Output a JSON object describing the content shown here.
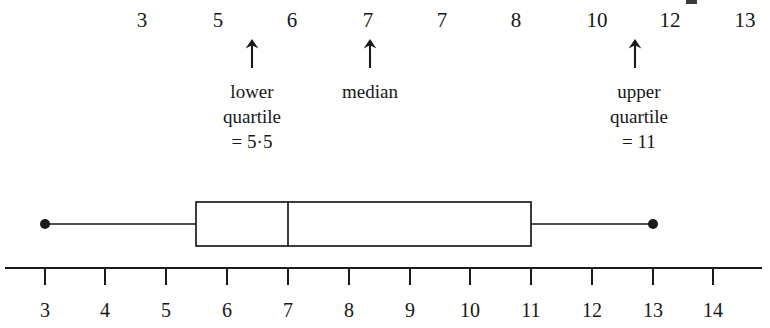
{
  "figure": {
    "type": "box-plot"
  },
  "data_list": {
    "label": "ordered data values",
    "values": [
      "3",
      "5",
      "6",
      "7",
      "7",
      "8",
      "10",
      "12",
      "13"
    ],
    "x_positions": [
      142,
      218,
      292,
      368,
      442,
      516,
      597,
      670,
      745
    ]
  },
  "annotations": [
    {
      "name": "lower-quartile",
      "arrow_x": 252,
      "lines": [
        "lower",
        "quartile",
        "= 5·5"
      ]
    },
    {
      "name": "median",
      "arrow_x": 370,
      "lines": [
        "median"
      ]
    },
    {
      "name": "upper-quartile",
      "arrow_x": 635,
      "lines": [
        "upper",
        "quartile",
        "= 11"
      ]
    }
  ],
  "axis": {
    "ticks": [
      "3",
      "4",
      "5",
      "6",
      "7",
      "8",
      "9",
      "10",
      "11",
      "12",
      "13",
      "14"
    ],
    "tick_x": [
      45,
      105,
      166,
      227,
      288,
      349,
      410,
      470,
      531,
      592,
      653,
      713
    ],
    "line_start_x": 5,
    "line_end_x": 762,
    "line_y": 268,
    "tick_length": 17
  },
  "chart_data": {
    "type": "box",
    "title": "",
    "xlabel": "",
    "ylabel": "",
    "xlim": [
      3,
      14
    ],
    "grid": false,
    "legend": "none",
    "dataset": [
      "3",
      "5",
      "6",
      "7",
      "7",
      "8",
      "10",
      "12",
      "13"
    ],
    "five_number_summary": {
      "minimum": 3,
      "lower_quartile": 5.5,
      "median": 7,
      "upper_quartile": 11,
      "maximum": 13
    },
    "geometry": {
      "whisker_y": 224,
      "box_top_y": 202,
      "box_bottom_y": 246,
      "min_x": 45,
      "box_left_x": 196,
      "median_x": 288,
      "box_right_x": 531,
      "max_x": 653,
      "end_dot_radius": 5
    },
    "colors": {
      "stroke": "#1a1a1a",
      "fill": "#ffffff",
      "background": "#ffffff"
    }
  }
}
